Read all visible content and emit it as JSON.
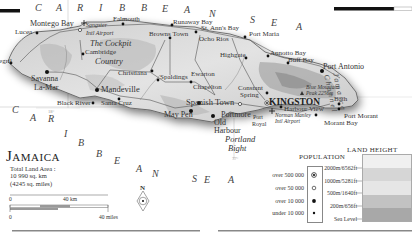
{
  "map": {
    "title": "Jamaica",
    "land_area": {
      "label": "Total Land Area :",
      "km": "10 990 sq. km",
      "miles": "(4245 sq. miles)"
    },
    "seas": {
      "caribbean_top": [
        "C",
        "A",
        "R",
        "I",
        "B",
        "B",
        "E",
        "A",
        "N",
        "S",
        "E",
        "A"
      ],
      "caribbean_bottom": [
        "C",
        "A",
        "R",
        "I",
        "B",
        "B",
        "E",
        "A",
        "N",
        "S",
        "E",
        "A"
      ],
      "channel": "Jamaica Channel"
    },
    "regions": {
      "cockpit_1": "The Cockpit",
      "cockpit_2": "Country",
      "bight_1": "Portland",
      "bight_2": "Bight"
    },
    "places": {
      "montego_bay": "Montego Bay",
      "lucea": "Lucea",
      "negril": "Negril",
      "savanna_1": "Savanna",
      "savanna_2": "La-Mar",
      "falmouth": "Falmouth",
      "runaway_bay": "Runaway Bay",
      "st_anns_bay": "St. Ann's Bay",
      "port_maria": "Port Maria",
      "sangster_1": "Sangster",
      "sangster_2": "Intl Airport",
      "browns_town": "Browns Town",
      "ocho_rios": "Ocho Rios",
      "cambridge": "Cambridge",
      "highgate": "Highgate",
      "annotto_bay": "Annotto Bay",
      "buff_bay": "Buff Bay",
      "port_antonio": "Port Antonio",
      "christiana": "Christiana",
      "spaldings": "Spaldings",
      "ewarton": "Ewarton",
      "mandeville": "Mandeville",
      "chapelton": "Chapelton",
      "constant_spring_1": "Constant",
      "constant_spring_2": "Spring",
      "blue_mountain_1": "Blue Mountain",
      "blue_mountain_2": "Peak 2256m",
      "black_river": "Black River",
      "santa_cruz": "Santa Cruz",
      "spanish_town": "Spanish Town",
      "kingston": "KINGSTON",
      "harbour_view": "Harbour View",
      "bath": "Bath",
      "portmore": "Portmore",
      "may_pen": "May Pen",
      "old_harbour_1": "Old",
      "old_harbour_2": "Harbour",
      "port_royal_1": "Port",
      "port_royal_2": "Royal",
      "norman_manley_1": "Norman Manley",
      "norman_manley_2": "Intl Airport",
      "port_morant": "Port Morant",
      "morant_bay": "Morant Bay"
    },
    "graticule": {
      "lat": "18°",
      "lon": "77°"
    }
  },
  "scale": {
    "km_zero": "0",
    "km_end": "40 km",
    "mi_zero": "0",
    "mi_end": "40 miles"
  },
  "compass": {
    "north": "N"
  },
  "population_legend": {
    "title": "POPULATION",
    "rows": [
      {
        "label": "over 500 000",
        "symbol": "capital-dot"
      },
      {
        "label": "over 50 000",
        "symbol": "open-circle"
      },
      {
        "label": "over 10 000",
        "symbol": "large-dot"
      },
      {
        "label": "under 10 000",
        "symbol": "small-dot"
      }
    ]
  },
  "land_height_legend": {
    "title": "LAND HEIGHT",
    "rows": [
      {
        "label": "2000m/6562ft"
      },
      {
        "label": "1000m/5281ft"
      },
      {
        "label": "500m/1640ft"
      },
      {
        "label": "200m/656ft"
      },
      {
        "label": "Sea Level"
      }
    ],
    "colors": [
      "#f0f0f0",
      "#d6d6d6",
      "#e6e6e6",
      "#c2c2c2",
      "#a8a8a8"
    ]
  }
}
